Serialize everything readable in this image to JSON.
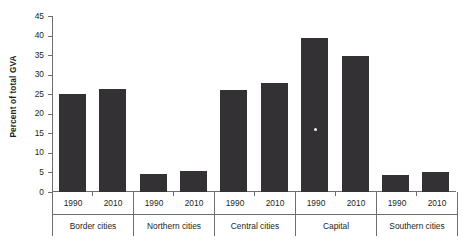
{
  "chart_data": {
    "type": "bar",
    "title": "",
    "subtitle": "",
    "xlabel": "",
    "ylabel": "Percent of total GVA",
    "ylim": [
      0,
      45
    ],
    "yticks": [
      0,
      5,
      10,
      15,
      20,
      25,
      30,
      35,
      40,
      45
    ],
    "ytick_labels": [
      "0",
      "5",
      "10",
      "15",
      "20",
      "25",
      "30",
      "35",
      "40",
      "45"
    ],
    "grid": false,
    "legend": null,
    "bar_color": "#333133",
    "axis_color": "#6d6e71",
    "categories": [
      "Border cities",
      "Northern cities",
      "Central cities",
      "Capital",
      "Southern cities"
    ],
    "series": [
      {
        "name": "1990",
        "values": [
          25.0,
          4.5,
          26.0,
          39.3,
          4.4
        ]
      },
      {
        "name": "2010",
        "values": [
          26.3,
          5.3,
          27.8,
          34.8,
          5.0
        ]
      }
    ],
    "groups": [
      {
        "name": "Border cities",
        "bars": [
          {
            "year": "1990",
            "value": 25.0
          },
          {
            "year": "2010",
            "value": 26.3
          }
        ]
      },
      {
        "name": "Northern cities",
        "bars": [
          {
            "year": "1990",
            "value": 4.5
          },
          {
            "year": "2010",
            "value": 5.3
          }
        ]
      },
      {
        "name": "Central cities",
        "bars": [
          {
            "year": "1990",
            "value": 26.0
          },
          {
            "year": "2010",
            "value": 27.8
          }
        ]
      },
      {
        "name": "Capital",
        "bars": [
          {
            "year": "1990",
            "value": 39.3
          },
          {
            "year": "2010",
            "value": 34.8
          }
        ]
      },
      {
        "name": "Southern cities",
        "bars": [
          {
            "year": "1990",
            "value": 4.4
          },
          {
            "year": "2010",
            "value": 5.0
          }
        ]
      }
    ],
    "annotations": [
      {
        "type": "artifact-dot",
        "group": "Capital",
        "year": "1990",
        "value": 15.5,
        "color": "#f2f2f2"
      }
    ]
  }
}
